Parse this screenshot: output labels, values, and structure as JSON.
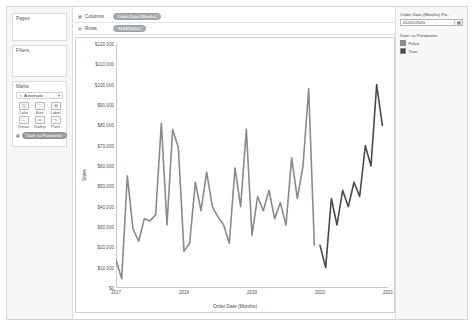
{
  "shelves": {
    "pages_label": "Pages",
    "filters_label": "Filters",
    "marks_label": "Marks",
    "columns_label": "Columns",
    "rows_label": "Rows",
    "columns_pill": "Order Date (Months)",
    "rows_pill": "SUM(Sales)",
    "columns_icon": "grid-columns-icon",
    "rows_icon": "grid-rows-icon"
  },
  "marks": {
    "type_value": "Automatic",
    "type_icon": "line-mark-icon",
    "caret_icon": "▾",
    "buttons": [
      {
        "label": "Color",
        "icon": "color-icon",
        "glyph": "◫"
      },
      {
        "label": "Size",
        "icon": "size-icon",
        "glyph": "⬚"
      },
      {
        "label": "Label",
        "icon": "label-icon",
        "glyph": "▤"
      },
      {
        "label": "Detail",
        "icon": "detail-icon",
        "glyph": "∴"
      },
      {
        "label": "Tooltip",
        "icon": "tooltip-icon",
        "glyph": "▭"
      },
      {
        "label": "Path",
        "icon": "path-icon",
        "glyph": "∿"
      }
    ],
    "pill_label": "Date >= Parameter",
    "pill_icon": "color-swatch-icon"
  },
  "parameter_card": {
    "title": "Order Date (Months) Pa...",
    "value": "01/01/2020",
    "stepper_icon": "calendar-icon",
    "stepper_glyph": "▦"
  },
  "legend": {
    "title": "Date >= Parameter",
    "items": [
      {
        "label": "False",
        "color": "#8a8a8a"
      },
      {
        "label": "True",
        "color": "#4a4a4a"
      }
    ]
  },
  "chart_data": {
    "type": "line",
    "title": "",
    "xlabel": "Order Date (Months)",
    "ylabel": "Sales",
    "ylim": [
      0,
      120000
    ],
    "ytick_values": [
      0,
      10000,
      20000,
      30000,
      40000,
      50000,
      60000,
      70000,
      80000,
      90000,
      100000,
      110000,
      120000
    ],
    "ytick_labels": [
      "$0",
      "$10,000",
      "$20,000",
      "$30,000",
      "$40,000",
      "$50,000",
      "$60,000",
      "$70,000",
      "$80,000",
      "$90,000",
      "$100,000",
      "$110,000",
      "$120,000"
    ],
    "xtick_values": [
      0,
      12,
      24,
      36,
      48
    ],
    "xtick_labels": [
      "2017",
      "2018",
      "2019",
      "2020",
      "2021"
    ],
    "grid": false,
    "legend_position": "right",
    "line_color": "#5a5a5a",
    "x_index_label": "months since Jan 2017",
    "series": [
      {
        "name": "False",
        "color": "#8a8a8a",
        "x": [
          0,
          1,
          2,
          3,
          4,
          5,
          6,
          7,
          8,
          9,
          10,
          11,
          12,
          13,
          14,
          15,
          16,
          17,
          18,
          19,
          20,
          21,
          22,
          23,
          24,
          25,
          26,
          27,
          28,
          29,
          30,
          31,
          32,
          33,
          34,
          35
        ],
        "values": [
          14000,
          4500,
          55000,
          29000,
          23000,
          34000,
          33000,
          36000,
          81000,
          31000,
          78000,
          69000,
          18000,
          22000,
          52000,
          38000,
          57000,
          40000,
          35000,
          31000,
          22000,
          59000,
          40000,
          78000,
          26000,
          45000,
          38000,
          48000,
          34000,
          42000,
          31000,
          64000,
          44000,
          60000,
          98000,
          21000
        ]
      },
      {
        "name": "True",
        "color": "#4a4a4a",
        "x": [
          36,
          37,
          38,
          39,
          40,
          41,
          42,
          43,
          44,
          45,
          46,
          47
        ],
        "values": [
          21000,
          10000,
          44000,
          31000,
          48000,
          40000,
          52000,
          45000,
          70000,
          60000,
          100000,
          80000
        ]
      }
    ]
  }
}
